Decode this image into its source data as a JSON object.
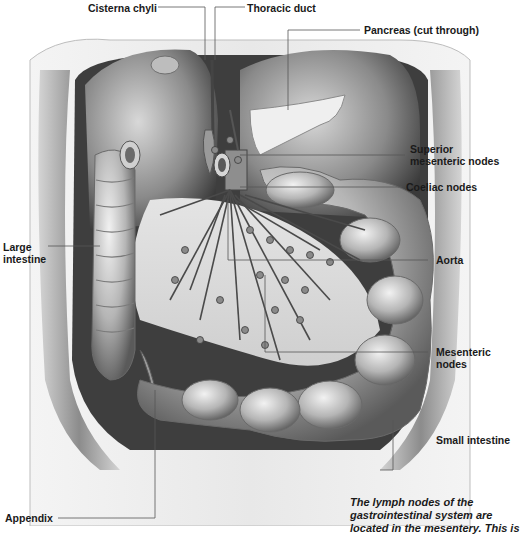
{
  "figure": {
    "subject": "Lymph nodes of the gastrointestinal system",
    "labels": {
      "cisterna_chyli": "Cisterna chyli",
      "thoracic_duct": "Thoracic duct",
      "pancreas": "Pancreas (cut through)",
      "superior_mesenteric_1": "Superior",
      "superior_mesenteric_2": "mesenteric nodes",
      "coeliac_nodes": "Coeliac nodes",
      "large_intestine_1": "Large",
      "large_intestine_2": "intestine",
      "aorta": "Aorta",
      "mesenteric_nodes_1": "Mesenteric",
      "mesenteric_nodes_2": "nodes",
      "small_intestine": "Small intestine",
      "appendix": "Appendix"
    },
    "caption": {
      "line1": "The lymph nodes of the",
      "line2": "gastrointestinal system are",
      "line3": "located in the mesentery. This is"
    },
    "colors": {
      "label_text": "#1a1a1a",
      "leader_line": "#555555",
      "tissue_light": "#e6e6e6",
      "tissue_mid": "#a8a8a8",
      "tissue_dark": "#4a4a4a",
      "background": "#ffffff"
    }
  }
}
